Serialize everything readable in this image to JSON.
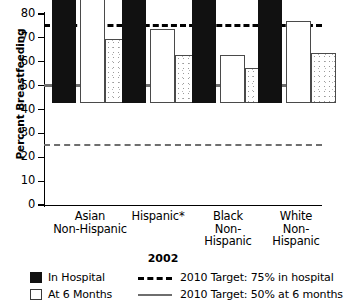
{
  "chart_data": {
    "type": "bar",
    "title": "",
    "xlabel": "2002",
    "ylabel": "Percent Breastfeeding",
    "categories": [
      "Asian\nNon-Hispanic",
      "Hispanic*",
      "Black\nNon-\nHispanic",
      "White\nNon-\nHispanic"
    ],
    "category_lines": [
      [
        "Asian",
        "Non-Hispanic"
      ],
      [
        "Hispanic*"
      ],
      [
        "Black",
        "Non-",
        "Hispanic"
      ],
      [
        "White",
        "Non-",
        "Hispanic"
      ]
    ],
    "series": [
      {
        "name": "In Hospital",
        "values": [
          80,
          76,
          52,
          77.5
        ],
        "style": "black-filled"
      },
      {
        "name": "At 6 Months",
        "values": [
          46,
          31,
          20,
          34.5
        ],
        "style": "white-outlined"
      },
      {
        "name": "At 6 Months (stippled)",
        "values": [
          27,
          20,
          14.5,
          21
        ],
        "style": "dotted-fill"
      }
    ],
    "ylim": [
      0,
      80
    ],
    "yticks": [
      0,
      10,
      20,
      30,
      40,
      50,
      60,
      70,
      80
    ],
    "ytick_labels": [
      "0",
      "10",
      "20",
      "30",
      "40",
      "50",
      "60",
      "70",
      "80"
    ],
    "grid": false,
    "legend_position": "bottom",
    "reference_lines": [
      {
        "value": 75,
        "label": "2010 Target: 75% in hospital",
        "style": "dashed",
        "color": "#000000"
      },
      {
        "value": 50,
        "label": "2010 Target: 50% at 6 months",
        "style": "solid",
        "color": "#6e6e6e"
      },
      {
        "value": 25,
        "label": "",
        "style": "dashed",
        "color": "#6e6e6e"
      }
    ]
  },
  "legend": {
    "items": [
      {
        "label": "In Hospital",
        "swatch": "black-square-icon"
      },
      {
        "label": "At 6 Months",
        "swatch": "white-square-icon"
      },
      {
        "label": "2010 Target: 75% in hospital",
        "swatch": "dashed-line-icon"
      },
      {
        "label": "2010 Target: 50% at 6 months",
        "swatch": "solid-line-icon"
      }
    ]
  },
  "colors": {
    "bar_hospital": "#111111",
    "bar_six_months_fill": "#ffffff",
    "bar_outline": "#4a4a4a",
    "target_75_line": "#000000",
    "target_50_line": "#6e6e6e",
    "line_25": "#6e6e6e",
    "axis": "#000000"
  }
}
